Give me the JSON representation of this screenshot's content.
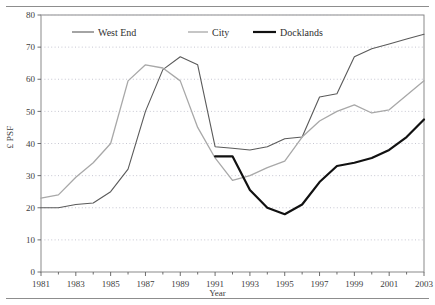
{
  "figure": {
    "y_axis_title": "£ PSF",
    "x_axis_title": "Year"
  },
  "legend": {
    "items": [
      {
        "label": "West End",
        "color": "#5a5a5a",
        "width": 1.1
      },
      {
        "label": "City",
        "color": "#a8a8a8",
        "width": 1.3
      },
      {
        "label": "Docklands",
        "color": "#111111",
        "width": 2.2
      }
    ]
  },
  "chart_data": {
    "type": "line",
    "title": "",
    "xlabel": "Year",
    "ylabel": "£ PSF",
    "xlim": [
      1981,
      2003
    ],
    "ylim": [
      0,
      80
    ],
    "yticks": [
      0,
      10,
      20,
      30,
      40,
      50,
      60,
      70,
      80
    ],
    "xticks": [
      1981,
      1983,
      1985,
      1987,
      1989,
      1991,
      1993,
      1995,
      1997,
      1999,
      2001,
      2003
    ],
    "xtick_labels": [
      "1981",
      "1983",
      "1985",
      "1987",
      "1989",
      "1991",
      "1993",
      "1995",
      "1997",
      "1999",
      "2001",
      "2003"
    ],
    "ytick_labels": [
      "0",
      "10",
      "20",
      "30",
      "40",
      "50",
      "60",
      "70",
      "80"
    ],
    "grid": "horizontal-dotted",
    "legend_position": "top-center-inside",
    "x": [
      1981,
      1982,
      1983,
      1984,
      1985,
      1986,
      1987,
      1988,
      1989,
      1990,
      1991,
      1992,
      1993,
      1994,
      1995,
      1996,
      1997,
      1998,
      1999,
      2000,
      2001,
      2002,
      2003
    ],
    "series": [
      {
        "name": "West End",
        "color": "#5a5a5a",
        "values": [
          20,
          20,
          21,
          21.5,
          25,
          32,
          50,
          63,
          67,
          64.5,
          39,
          38.5,
          38,
          39,
          41.5,
          42,
          54.5,
          55.5,
          67,
          69.5,
          71,
          72.5,
          74
        ]
      },
      {
        "name": "City",
        "color": "#a8a8a8",
        "values": [
          23,
          24,
          29.5,
          34,
          40,
          59.5,
          64.5,
          63.5,
          59.5,
          45,
          35.5,
          28.5,
          30,
          32.5,
          34.5,
          42,
          47,
          50,
          52,
          49.5,
          50.5,
          55,
          59.5
        ]
      },
      {
        "name": "Docklands",
        "color": "#111111",
        "values": [
          null,
          null,
          null,
          null,
          null,
          null,
          null,
          null,
          null,
          null,
          36,
          36,
          25.5,
          20,
          18,
          21,
          28,
          33,
          34,
          35.5,
          38,
          42,
          47.5
        ]
      }
    ]
  }
}
